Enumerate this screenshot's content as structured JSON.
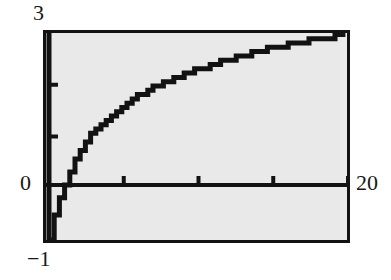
{
  "figure": {
    "background_color": "#ffffff",
    "plot_fill_color": "#e9e9e9",
    "frame_color": "#121212",
    "curve_color": "#121212"
  },
  "labels": {
    "y_max": "3",
    "y_zero": "0",
    "y_min": "−1",
    "x_max": "20"
  },
  "chart_data": {
    "type": "line",
    "title": "",
    "xlabel": "",
    "ylabel": "",
    "xlim": [
      0,
      20
    ],
    "ylim": [
      -1,
      3
    ],
    "grid": false,
    "legend": null,
    "x_ticks": [
      5,
      10,
      15,
      20
    ],
    "y_ticks": [
      1,
      2
    ],
    "axis_tick_labels": {
      "y_top": "3",
      "y_origin": "0",
      "y_bottom": "−1",
      "x_right": "20"
    },
    "rendering": "stair-stepped low-resolution plot, curve clipped at y = -1",
    "series": [
      {
        "name": "log(x)",
        "x": [
          0.05,
          0.1,
          0.15,
          0.2,
          0.25,
          0.3,
          0.4,
          0.5,
          0.6,
          0.7,
          0.8,
          0.9,
          1.0,
          1.2,
          1.4,
          1.6,
          1.8,
          2.0,
          2.5,
          3.0,
          3.5,
          4.0,
          4.5,
          5.0,
          6.0,
          7.0,
          8.0,
          9.0,
          10.0,
          11.0,
          12.0,
          13.0,
          14.0,
          15.0,
          16.0,
          17.0,
          18.0,
          19.0,
          20.0
        ],
        "y": [
          -1.0,
          -1.0,
          -0.95,
          -0.8,
          -0.69,
          -0.6,
          -0.46,
          -0.35,
          -0.26,
          -0.18,
          -0.11,
          -0.05,
          0.0,
          0.18,
          0.34,
          0.47,
          0.59,
          0.69,
          0.92,
          1.1,
          1.25,
          1.39,
          1.5,
          1.61,
          1.79,
          1.95,
          2.08,
          2.2,
          2.3,
          2.4,
          2.48,
          2.56,
          2.64,
          2.71,
          2.77,
          2.83,
          2.89,
          2.94,
          2.996
        ]
      }
    ]
  }
}
